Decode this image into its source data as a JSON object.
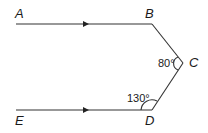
{
  "diagram": {
    "type": "geometry",
    "points": {
      "A": {
        "label": "A",
        "x": 16,
        "y": 24
      },
      "B": {
        "label": "B",
        "x": 152,
        "y": 24
      },
      "C": {
        "label": "C",
        "x": 183,
        "y": 63
      },
      "D": {
        "label": "D",
        "x": 152,
        "y": 110
      },
      "E": {
        "label": "E",
        "x": 16,
        "y": 110
      }
    },
    "segments": [
      "AB",
      "BC",
      "CD",
      "DE"
    ],
    "parallel_marks": [
      "AB",
      "ED"
    ],
    "angles": [
      {
        "vertex": "C",
        "label": "80°"
      },
      {
        "vertex": "D",
        "label": "130°"
      }
    ]
  }
}
